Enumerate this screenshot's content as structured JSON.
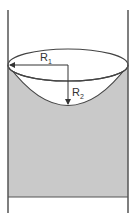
{
  "diagram": {
    "type": "meniscus-in-tube",
    "labels": {
      "r1_main": "R",
      "r1_sub": "1",
      "r2_main": "R",
      "r2_sub": "2"
    },
    "colors": {
      "fluid": "#c9c9c9",
      "stroke": "#444444",
      "wall": "#555555",
      "background": "#ffffff"
    }
  }
}
